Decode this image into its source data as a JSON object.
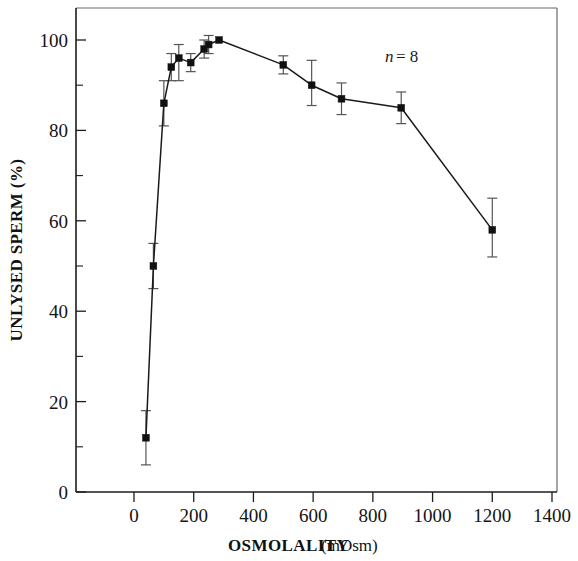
{
  "figure": {
    "background_color": "#ffffff",
    "line_color": "#1a1a1a",
    "marker_color": "#111111",
    "error_bar_color": "#555555"
  },
  "chart_data": {
    "type": "line",
    "title": "",
    "subtitle": "",
    "xlabel": "OSMOLALITY",
    "xlabel_unit": "(mOsm)",
    "ylabel": "UNLYSED SPERM (%)",
    "xlim": [
      -60,
      1460
    ],
    "ylim": [
      0,
      107
    ],
    "grid": false,
    "legend": "none",
    "xticks": [
      0,
      200,
      400,
      600,
      800,
      1000,
      1200,
      1400
    ],
    "xticklabels": [
      "0",
      "200",
      "400",
      "600",
      "800",
      "1000",
      "1200",
      "1400"
    ],
    "xticks_minor": [
      100,
      300,
      500,
      700,
      900,
      1100,
      1300
    ],
    "yticks": [
      0,
      20,
      40,
      60,
      80,
      100
    ],
    "yticklabels": [
      "0",
      "20",
      "40",
      "60",
      "80",
      "100"
    ],
    "yticks_minor": [
      10,
      30,
      50,
      70,
      90
    ],
    "annotations": [
      {
        "name": "sample-size",
        "n_symbol": "n",
        "equals": "= 8",
        "x": 950,
        "y": 97
      }
    ],
    "series": [
      {
        "name": "Unlysed sperm",
        "marker": "square",
        "x": [
          40,
          65,
          100,
          125,
          150,
          190,
          235,
          250,
          285,
          500,
          595,
          695,
          895,
          1200
        ],
        "values": [
          12,
          50,
          86,
          94,
          96,
          95,
          98,
          99,
          100,
          94.5,
          90,
          87,
          85,
          58
        ],
        "err_low": [
          6,
          45,
          81,
          91,
          91,
          93,
          96,
          97,
          100,
          92.5,
          85.5,
          83.5,
          81.5,
          52
        ],
        "err_high": [
          18,
          55,
          91,
          97,
          99,
          97,
          100,
          101,
          100,
          96.5,
          95.5,
          90.5,
          88.5,
          65
        ]
      }
    ]
  }
}
